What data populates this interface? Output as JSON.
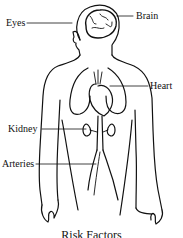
{
  "diagram": {
    "type": "anatomical-figure",
    "labels": [
      {
        "id": "eyes",
        "text": "Eyes"
      },
      {
        "id": "brain",
        "text": "Brain"
      },
      {
        "id": "heart",
        "text": "Heart"
      },
      {
        "id": "kidney",
        "text": "Kidney"
      },
      {
        "id": "arteries",
        "text": "Arteries"
      }
    ],
    "caption": "Risk Factors",
    "colors": {
      "ink": "#111111",
      "background": "#ffffff"
    }
  }
}
